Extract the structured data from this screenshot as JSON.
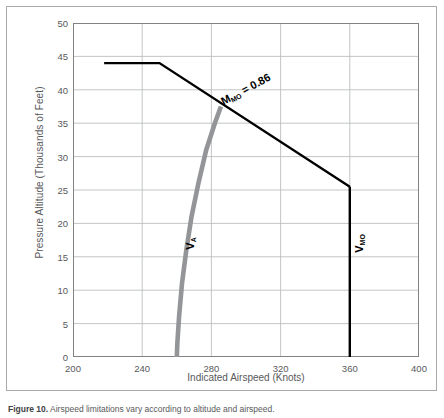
{
  "figure": {
    "caption_number": "Figure 10.",
    "caption_text": "Airspeed limitations vary according to altitude and airspeed."
  },
  "colors": {
    "frame": "#a7a9ac",
    "grid": "#bcbec0",
    "axis": "#808285",
    "text": "#58595b",
    "mmo_line": "#000000",
    "vmo_line": "#000000",
    "va_curve": "#939598"
  },
  "chart_data": {
    "type": "line",
    "title": "",
    "xlabel": "Indicated Airspeed (Knots)",
    "ylabel": "Pressure Altitude (Thousands of Feet)",
    "xlim": [
      200,
      400
    ],
    "ylim": [
      0,
      50
    ],
    "xticks": [
      200,
      240,
      280,
      320,
      360,
      400
    ],
    "yticks": [
      0,
      5,
      10,
      15,
      20,
      25,
      30,
      35,
      40,
      45,
      50
    ],
    "grid": true,
    "legend": "none",
    "annotations": [
      {
        "id": "mmo-label",
        "text": "M",
        "sub": "MO",
        "suffix": " = 0.86",
        "rotation": -28,
        "x": 300,
        "y": 40
      },
      {
        "id": "vmo-label",
        "text": "V",
        "sub": "MO",
        "rotation": -90,
        "x": 366,
        "y": 17
      },
      {
        "id": "va-label",
        "text": "V",
        "sub": "A",
        "rotation": -90,
        "x": 268,
        "y": 17
      }
    ],
    "series": [
      {
        "name": "Mmo limit",
        "label": "Mmo = 0.86",
        "color": "#000000",
        "width": 2.4,
        "points": [
          [
            218,
            44
          ],
          [
            250,
            44
          ],
          [
            360,
            25.5
          ]
        ]
      },
      {
        "name": "Vmo limit",
        "label": "Vmo",
        "color": "#000000",
        "width": 2.4,
        "points": [
          [
            360,
            25.5
          ],
          [
            360,
            0
          ]
        ]
      },
      {
        "name": "Va maneuvering speed",
        "label": "Va",
        "color": "#939598",
        "width": 4.6,
        "points": [
          [
            285.5,
            37.5
          ],
          [
            282,
            35
          ],
          [
            277,
            31
          ],
          [
            272.5,
            26
          ],
          [
            268.5,
            21
          ],
          [
            265.5,
            16
          ],
          [
            263,
            11
          ],
          [
            261.3,
            6
          ],
          [
            260.3,
            2
          ],
          [
            260,
            0
          ]
        ]
      }
    ]
  },
  "ticklabels": {
    "x": [
      "200",
      "240",
      "280",
      "320",
      "360",
      "400"
    ],
    "y": [
      "0",
      "5",
      "10",
      "15",
      "20",
      "25",
      "30",
      "35",
      "40",
      "45",
      "50"
    ]
  }
}
